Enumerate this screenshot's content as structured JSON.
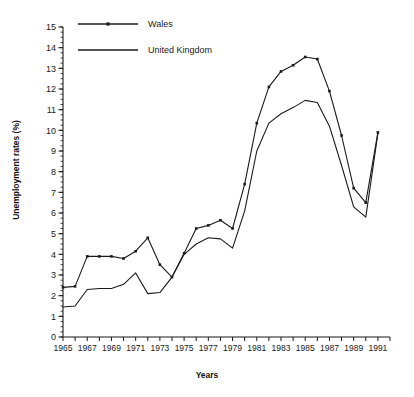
{
  "chart_data": {
    "type": "line",
    "title": "",
    "xlabel": "Years",
    "ylabel": "Unemployment rates (%)",
    "xlim": [
      1965,
      1992
    ],
    "ylim": [
      0,
      15
    ],
    "ytick_step": 1,
    "ytick_minor_step": 0.25,
    "xtick_step": 1,
    "xtick_label_step": 2,
    "grid": false,
    "legend_position": "top-left-inside",
    "x": [
      1965,
      1966,
      1967,
      1968,
      1969,
      1970,
      1971,
      1972,
      1973,
      1974,
      1975,
      1976,
      1977,
      1978,
      1979,
      1980,
      1981,
      1982,
      1983,
      1984,
      1985,
      1986,
      1987,
      1988,
      1989,
      1990,
      1991
    ],
    "xtick_labels": [
      "1965",
      "1967",
      "1969",
      "1971",
      "1973",
      "1975",
      "1977",
      "1979",
      "1981",
      "1983",
      "1985",
      "1987",
      "1989",
      "1991"
    ],
    "ytick_labels": [
      "0",
      "1",
      "2",
      "3",
      "4",
      "5",
      "6",
      "7",
      "8",
      "9",
      "10",
      "11",
      "12",
      "13",
      "14",
      "15"
    ],
    "series": [
      {
        "name": "Wales",
        "marker": "square",
        "color": "#1a1a1a",
        "values": [
          2.4,
          2.45,
          3.9,
          3.9,
          3.9,
          3.8,
          4.15,
          4.8,
          3.5,
          2.9,
          4.05,
          5.25,
          5.4,
          5.65,
          5.25,
          7.4,
          10.35,
          12.1,
          12.85,
          13.15,
          13.55,
          13.45,
          11.9,
          9.75,
          7.2,
          6.5,
          9.9
        ]
      },
      {
        "name": "United Kingdom",
        "marker": "none",
        "color": "#1a1a1a",
        "values": [
          1.45,
          1.5,
          2.3,
          2.35,
          2.35,
          2.55,
          3.1,
          2.1,
          2.15,
          2.9,
          4.0,
          4.5,
          4.8,
          4.75,
          4.3,
          6.1,
          9.0,
          10.35,
          10.8,
          11.1,
          11.45,
          11.35,
          10.2,
          8.3,
          6.3,
          5.8,
          9.85
        ]
      }
    ]
  },
  "legend": {
    "items": [
      {
        "label": "Wales",
        "marker": "square"
      },
      {
        "label": "United Kingdom",
        "marker": "none"
      }
    ]
  }
}
